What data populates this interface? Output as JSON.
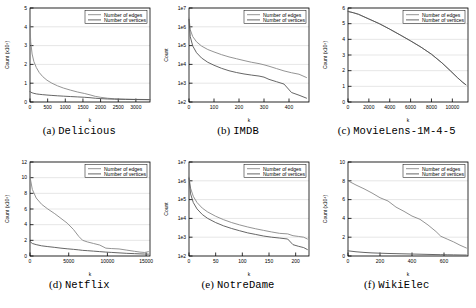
{
  "figure": {
    "legend_series": [
      "Number of edges",
      "Number of vertices"
    ],
    "colors": {
      "edges": "#888888",
      "vertices": "#555555",
      "grid": "#cccccc",
      "axis": "#000000"
    }
  },
  "panels": [
    {
      "caption_index": "(a)",
      "caption_name": "Delicious",
      "chart_data": {
        "type": "line",
        "title": "Delicious",
        "xlabel": "k",
        "ylabel": "Count (x10⁵)",
        "yscale": "linear",
        "xlim": [
          0,
          3400
        ],
        "ylim": [
          0,
          5
        ],
        "xticks": [
          0,
          500,
          1000,
          1500,
          2000,
          2500,
          3000
        ],
        "yticks": [
          0,
          1,
          2,
          3,
          4,
          5
        ],
        "grid": true,
        "legend_position": "top-right",
        "series": [
          {
            "name": "Number of edges",
            "x": [
              0,
              20,
              60,
              110,
              180,
              260,
              360,
              480,
              620,
              780,
              950,
              1150,
              1350,
              1550,
              1700,
              1850,
              2000,
              2200,
              2400,
              2700,
              3000,
              3400
            ],
            "values": [
              4.1,
              3.2,
              2.55,
              2.15,
              1.83,
              1.57,
              1.35,
              1.16,
              1.0,
              0.86,
              0.74,
              0.63,
              0.53,
              0.45,
              0.38,
              0.3,
              0.25,
              0.2,
              0.17,
              0.15,
              0.14,
              0.13
            ]
          },
          {
            "name": "Number of vertices",
            "x": [
              0,
              20,
              60,
              110,
              180,
              260,
              360,
              480,
              620,
              780,
              950,
              1150,
              1350,
              1550,
              1700,
              1850,
              2000,
              2200,
              2400,
              2700,
              3000,
              3400
            ],
            "values": [
              0.56,
              0.52,
              0.49,
              0.46,
              0.43,
              0.41,
              0.39,
              0.37,
              0.35,
              0.33,
              0.31,
              0.29,
              0.27,
              0.25,
              0.23,
              0.2,
              0.18,
              0.16,
              0.15,
              0.14,
              0.13,
              0.12
            ]
          }
        ]
      }
    },
    {
      "caption_index": "(b)",
      "caption_name": "IMDB",
      "chart_data": {
        "type": "line",
        "title": "IMDB",
        "xlabel": "k",
        "ylabel": "Count",
        "yscale": "log",
        "xlim": [
          0,
          480
        ],
        "ylim": [
          100,
          10000000
        ],
        "xticks": [
          0,
          100,
          200,
          300,
          400
        ],
        "yticks": [
          100,
          1000,
          10000,
          100000,
          1000000,
          10000000
        ],
        "ytick_labels": [
          "1e2",
          "1e3",
          "1e4",
          "1e5",
          "1e6",
          "1e7"
        ],
        "grid": true,
        "legend_position": "top-right",
        "series": [
          {
            "name": "Number of edges",
            "x": [
              0,
              5,
              15,
              30,
              50,
              75,
              100,
              130,
              160,
              190,
              220,
              250,
              280,
              300,
              320,
              350,
              380,
              410,
              440,
              470
            ],
            "values": [
              3000000,
              700000,
              300000,
              160000,
              95000,
              62000,
              46000,
              33000,
              25000,
              20000,
              16000,
              13000,
              11000,
              9500,
              8000,
              6000,
              4500,
              3600,
              3000,
              2000
            ]
          },
          {
            "name": "Number of vertices",
            "x": [
              0,
              5,
              15,
              30,
              50,
              75,
              100,
              130,
              160,
              190,
              220,
              250,
              280,
              300,
              320,
              350,
              380,
              410,
              440,
              470
            ],
            "values": [
              2500000,
              300000,
              95000,
              42000,
              22000,
              13000,
              9000,
              6200,
              4600,
              3700,
              3100,
              2700,
              2400,
              2100,
              1600,
              1200,
              900,
              320,
              230,
              160
            ]
          }
        ]
      }
    },
    {
      "caption_index": "(c)",
      "caption_name": "MovieLens-1M-4-5",
      "chart_data": {
        "type": "line",
        "title": "MovieLens-1M-4-5",
        "xlabel": "k",
        "ylabel": "Count (x10⁵)",
        "yscale": "linear",
        "xlim": [
          0,
          11500
        ],
        "ylim": [
          0,
          6
        ],
        "xticks": [
          0,
          2000,
          4000,
          6000,
          8000,
          10000
        ],
        "yticks": [
          0,
          1,
          2,
          3,
          4,
          5,
          6
        ],
        "grid": true,
        "legend_position": "top-right",
        "series": [
          {
            "name": "Number of edges",
            "x": [
              0,
              500,
              1000,
              2000,
              3000,
              4000,
              5000,
              6000,
              7000,
              8000,
              9000,
              9800,
              10500,
              11000,
              11300
            ],
            "values": [
              5.78,
              5.7,
              5.6,
              5.3,
              5.0,
              4.65,
              4.28,
              3.9,
              3.5,
              3.05,
              2.5,
              2.0,
              1.55,
              1.25,
              1.1
            ]
          },
          {
            "name": "Number of vertices",
            "x": [
              0,
              500,
              1000,
              2000,
              3000,
              4000,
              5000,
              6000,
              7000,
              8000,
              9000,
              9800,
              10500,
              11000,
              11300
            ],
            "values": [
              5.78,
              5.7,
              5.6,
              5.3,
              5.0,
              4.65,
              4.28,
              3.9,
              3.5,
              3.05,
              2.5,
              2.0,
              1.55,
              1.25,
              1.1
            ]
          }
        ]
      }
    },
    {
      "caption_index": "(d)",
      "caption_name": "Netflix",
      "chart_data": {
        "type": "line",
        "title": "Netflix",
        "xlabel": "k",
        "ylabel": "Count (x10⁵)",
        "yscale": "linear",
        "xlim": [
          0,
          15500
        ],
        "ylim": [
          0,
          12
        ],
        "xticks": [
          0,
          5000,
          10000,
          15000
        ],
        "yticks": [
          0,
          2,
          4,
          6,
          8,
          10,
          12
        ],
        "grid": true,
        "legend_position": "top-right",
        "series": [
          {
            "name": "Number of edges",
            "x": [
              0,
              300,
              800,
              1500,
              2300,
              3200,
              4000,
              4800,
              5600,
              6300,
              6800,
              7400,
              8200,
              9000,
              9800,
              10500,
              11500,
              12500,
              13500,
              14200,
              14800,
              15300
            ],
            "values": [
              10.1,
              8.5,
              7.4,
              6.6,
              6.0,
              5.4,
              4.8,
              4.2,
              3.4,
              2.5,
              2.0,
              1.8,
              1.6,
              1.4,
              1.0,
              0.95,
              0.9,
              0.75,
              0.6,
              0.5,
              0.45,
              0.55
            ]
          },
          {
            "name": "Number of vertices",
            "x": [
              0,
              300,
              800,
              1500,
              2300,
              3200,
              4000,
              4800,
              5600,
              6300,
              6800,
              7400,
              8200,
              9000,
              9800,
              10500,
              11500,
              12500,
              13500,
              14200,
              14800,
              15300
            ],
            "values": [
              1.85,
              1.6,
              1.45,
              1.3,
              1.2,
              1.1,
              1.0,
              0.92,
              0.85,
              0.78,
              0.72,
              0.68,
              0.62,
              0.56,
              0.5,
              0.46,
              0.4,
              0.34,
              0.3,
              0.27,
              0.25,
              0.24
            ]
          }
        ]
      }
    },
    {
      "caption_index": "(e)",
      "caption_name": "NotreDame",
      "chart_data": {
        "type": "line",
        "title": "NotreDame",
        "xlabel": "k",
        "ylabel": "Count",
        "yscale": "log",
        "xlim": [
          0,
          225
        ],
        "ylim": [
          100,
          10000000
        ],
        "xticks": [
          0,
          50,
          100,
          150,
          200
        ],
        "yticks": [
          100,
          1000,
          10000,
          100000,
          1000000,
          10000000
        ],
        "ytick_labels": [
          "1e2",
          "1e3",
          "1e4",
          "1e5",
          "1e6",
          "1e7"
        ],
        "grid": true,
        "legend_position": "top-right",
        "series": [
          {
            "name": "Number of edges",
            "x": [
              0,
              3,
              8,
              15,
              25,
              35,
              50,
              65,
              80,
              95,
              110,
              125,
              140,
              155,
              170,
              185,
              195,
              205,
              215,
              222
            ],
            "values": [
              1600000,
              400000,
              150000,
              70000,
              35000,
              22000,
              13000,
              8500,
              6000,
              4500,
              3500,
              2800,
              2300,
              1900,
              1600,
              1500,
              1200,
              1100,
              1000,
              800
            ]
          },
          {
            "name": "Number of vertices",
            "x": [
              0,
              3,
              8,
              15,
              25,
              35,
              50,
              65,
              80,
              95,
              110,
              125,
              140,
              155,
              170,
              185,
              195,
              205,
              215,
              222
            ],
            "values": [
              1400000,
              200000,
              70000,
              32000,
              16000,
              10000,
              6000,
              4000,
              2900,
              2200,
              1700,
              1400,
              1150,
              1000,
              900,
              800,
              400,
              330,
              280,
              220
            ]
          }
        ]
      }
    },
    {
      "caption_index": "(f)",
      "caption_name": "WikiElec",
      "chart_data": {
        "type": "line",
        "title": "WikiElec",
        "xlabel": "k",
        "ylabel": "Count (x10⁴)",
        "yscale": "linear",
        "xlim": [
          0,
          750
        ],
        "ylim": [
          0,
          10
        ],
        "xticks": [
          0,
          200,
          400,
          600
        ],
        "yticks": [
          0,
          2,
          4,
          6,
          8,
          10
        ],
        "grid": true,
        "legend_position": "top-right",
        "series": [
          {
            "name": "Number of edges",
            "x": [
              0,
              50,
              100,
              150,
              200,
              250,
              300,
              350,
              400,
              450,
              500,
              550,
              580,
              620,
              660,
              700,
              740
            ],
            "values": [
              8.0,
              7.55,
              7.15,
              6.7,
              6.2,
              5.85,
              5.2,
              4.75,
              4.25,
              3.9,
              3.3,
              2.6,
              2.1,
              1.8,
              1.5,
              1.15,
              0.85
            ]
          },
          {
            "name": "Number of vertices",
            "x": [
              0,
              50,
              100,
              150,
              200,
              250,
              300,
              350,
              400,
              450,
              500,
              550,
              580,
              620,
              660,
              700,
              740
            ],
            "values": [
              0.55,
              0.45,
              0.38,
              0.33,
              0.3,
              0.27,
              0.25,
              0.23,
              0.21,
              0.19,
              0.17,
              0.15,
              0.14,
              0.13,
              0.12,
              0.11,
              0.1
            ]
          }
        ]
      }
    }
  ]
}
